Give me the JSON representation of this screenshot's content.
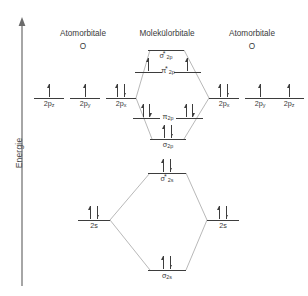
{
  "axis": {
    "label": "Energie",
    "icon": "up-arrow-axis-icon"
  },
  "headers": {
    "left": {
      "title": "Atomorbitale",
      "atom": "O"
    },
    "center": {
      "title": "Molekülorbitale"
    },
    "right": {
      "title": "Atomorbitale",
      "atom": "O"
    }
  },
  "colors": {
    "line": "#3d3d3d",
    "connector": "#9a9a9a",
    "text": "#3a3a3a",
    "background": "#ffffff"
  },
  "chart_data": {
    "type": "diagram",
    "ylabel": "Energie",
    "levels": [
      {
        "id": "ao-left-2pz",
        "group": "atomic-left",
        "label": "2p",
        "sub": "z",
        "star": false,
        "x": 34,
        "y": 98,
        "width": 30,
        "electrons": [
          "up"
        ]
      },
      {
        "id": "ao-left-2py",
        "group": "atomic-left",
        "label": "2p",
        "sub": "y",
        "star": false,
        "x": 70,
        "y": 98,
        "width": 30,
        "electrons": [
          "up"
        ]
      },
      {
        "id": "ao-left-2px",
        "group": "atomic-left",
        "label": "2p",
        "sub": "x",
        "star": false,
        "x": 106,
        "y": 98,
        "width": 30,
        "electrons": [
          "up",
          "down"
        ]
      },
      {
        "id": "ao-right-2px",
        "group": "atomic-right",
        "label": "2p",
        "sub": "x",
        "star": false,
        "x": 209,
        "y": 98,
        "width": 30,
        "electrons": [
          "up",
          "down"
        ]
      },
      {
        "id": "ao-right-2py",
        "group": "atomic-right",
        "label": "2p",
        "sub": "y",
        "star": false,
        "x": 245,
        "y": 98,
        "width": 30,
        "electrons": [
          "up"
        ]
      },
      {
        "id": "ao-right-2pz",
        "group": "atomic-right",
        "label": "2p",
        "sub": "z",
        "star": false,
        "x": 274,
        "y": 98,
        "width": 30,
        "electrons": [
          "up"
        ]
      },
      {
        "id": "mo-sigma-star-2p",
        "group": "molecular",
        "label": "σ",
        "sub": "2p",
        "star": true,
        "x": 148,
        "y": 50,
        "width": 36,
        "electrons": []
      },
      {
        "id": "mo-pi-star-2p-left",
        "group": "molecular",
        "label": "",
        "sub": "",
        "star": false,
        "x": 135,
        "y": 72,
        "width": 27,
        "electrons": [
          "up"
        ]
      },
      {
        "id": "mo-pi-star-2p-right",
        "group": "molecular",
        "label": "",
        "sub": "",
        "star": false,
        "x": 174,
        "y": 72,
        "width": 27,
        "electrons": [
          "up"
        ]
      },
      {
        "id": "mo-pi-star-2p-label",
        "group": "molecular-label",
        "label": "π",
        "sub": "2p",
        "star": true,
        "x": 150,
        "y": 72,
        "width": 36,
        "electrons": []
      },
      {
        "id": "mo-pi-2p-left",
        "group": "molecular",
        "label": "",
        "sub": "",
        "star": false,
        "x": 133,
        "y": 118,
        "width": 27,
        "electrons": [
          "up",
          "down"
        ]
      },
      {
        "id": "mo-pi-2p-right",
        "group": "molecular",
        "label": "",
        "sub": "",
        "star": false,
        "x": 176,
        "y": 118,
        "width": 27,
        "electrons": [
          "up",
          "down"
        ]
      },
      {
        "id": "mo-pi-2p-label",
        "group": "molecular-label",
        "label": "π",
        "sub": "2p",
        "star": false,
        "x": 150,
        "y": 118,
        "width": 36,
        "electrons": []
      },
      {
        "id": "mo-sigma-2p",
        "group": "molecular",
        "label": "σ",
        "sub": "2p",
        "star": false,
        "x": 150,
        "y": 139,
        "width": 36,
        "electrons": [
          "up",
          "down"
        ]
      },
      {
        "id": "mo-sigma-star-2s",
        "group": "molecular",
        "label": "σ",
        "sub": "2s",
        "star": true,
        "x": 148,
        "y": 173,
        "width": 38,
        "electrons": [
          "up",
          "down"
        ]
      },
      {
        "id": "ao-left-2s",
        "group": "atomic-left",
        "label": "2s",
        "sub": "",
        "star": false,
        "x": 78,
        "y": 220,
        "width": 32,
        "electrons": [
          "up",
          "down"
        ]
      },
      {
        "id": "ao-right-2s",
        "group": "atomic-right",
        "label": "2s",
        "sub": "",
        "star": false,
        "x": 207,
        "y": 220,
        "width": 32,
        "electrons": [
          "up",
          "down"
        ]
      },
      {
        "id": "mo-sigma-2s",
        "group": "molecular",
        "label": "σ",
        "sub": "2s",
        "star": false,
        "x": 148,
        "y": 270,
        "width": 38,
        "electrons": [
          "up",
          "down"
        ]
      }
    ],
    "connectors": [
      {
        "from": "ao-left-2px",
        "to": "mo-sigma-star-2p",
        "x1": 136,
        "y1": 98,
        "x2": 150,
        "y2": 50
      },
      {
        "from": "ao-right-2px",
        "to": "mo-sigma-star-2p",
        "x1": 209,
        "y1": 98,
        "x2": 184,
        "y2": 50
      },
      {
        "from": "ao-left-2px",
        "to": "mo-sigma-2p",
        "x1": 136,
        "y1": 98,
        "x2": 152,
        "y2": 139
      },
      {
        "from": "ao-right-2px",
        "to": "mo-sigma-2p",
        "x1": 209,
        "y1": 98,
        "x2": 184,
        "y2": 139
      },
      {
        "from": "ao-left-2s",
        "to": "mo-sigma-star-2s",
        "x1": 110,
        "y1": 220,
        "x2": 150,
        "y2": 173
      },
      {
        "from": "ao-right-2s",
        "to": "mo-sigma-star-2s",
        "x1": 207,
        "y1": 220,
        "x2": 186,
        "y2": 173
      },
      {
        "from": "ao-left-2s",
        "to": "mo-sigma-2s",
        "x1": 110,
        "y1": 220,
        "x2": 150,
        "y2": 270
      },
      {
        "from": "ao-right-2s",
        "to": "mo-sigma-2s",
        "x1": 207,
        "y1": 220,
        "x2": 186,
        "y2": 270
      }
    ]
  }
}
